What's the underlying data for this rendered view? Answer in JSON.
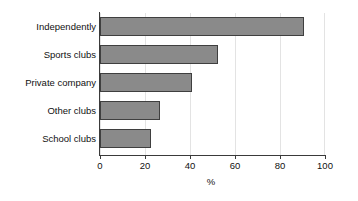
{
  "chart_data": {
    "type": "bar",
    "orientation": "horizontal",
    "title": "",
    "subtitle": "",
    "xlabel": "%",
    "ylabel": "",
    "categories": [
      "Independently",
      "Sports clubs",
      "Private company",
      "Other clubs",
      "School clubs"
    ],
    "values": [
      90.5,
      52.5,
      41,
      26.5,
      22.5
    ],
    "xlim": [
      0,
      100
    ],
    "xticks": [
      0,
      20,
      40,
      60,
      80,
      100
    ],
    "xtick_labels": [
      "0",
      "20",
      "40",
      "60",
      "80",
      "100"
    ],
    "grid": true,
    "grid_axis": "x",
    "legend": false,
    "legend_position": "none",
    "colors": {
      "bar_fill": "#8a8a8a",
      "bar_edge": "#3f3f3f",
      "axis": "#3a3a3a",
      "gridline": "#e3e3e3",
      "background": "#ffffff",
      "text": "#111111"
    }
  }
}
